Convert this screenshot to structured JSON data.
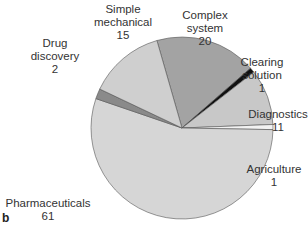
{
  "chart_data": {
    "type": "pie",
    "title": "",
    "panel_label": "b",
    "total": 112,
    "slices": [
      {
        "label": "Complex system",
        "value": 20,
        "color": "#a3a3a3"
      },
      {
        "label": "Clearing solution",
        "value": 1,
        "color": "#111111"
      },
      {
        "label": "Diagnostics",
        "value": 11,
        "color": "#c8c8c8"
      },
      {
        "label": "Agriculture",
        "value": 1,
        "color": "#f2f2f2"
      },
      {
        "label": "Pharmaceuticals",
        "value": 61,
        "color": "#d6d6d6"
      },
      {
        "label": "Drug discovery",
        "value": 2,
        "color": "#8a8a8a"
      },
      {
        "label": "Simple mechanical",
        "value": 15,
        "color": "#cfcfcf"
      }
    ]
  },
  "labels": {
    "complex_system": {
      "name": "Complex\nsystem",
      "l1": "Complex",
      "l2": "system",
      "value": "20"
    },
    "clearing_solution": {
      "l1": "Clearing",
      "l2": "solution",
      "value": "1"
    },
    "diagnostics": {
      "l1": "Diagnostics",
      "value": "11"
    },
    "agriculture": {
      "l1": "Agriculture",
      "value": "1"
    },
    "pharmaceuticals": {
      "l1": "Pharmaceuticals",
      "value": "61"
    },
    "drug_discovery": {
      "l1": "Drug",
      "l2": "discovery",
      "value": "2"
    },
    "simple_mechanical": {
      "l1": "Simple",
      "l2": "mechanical",
      "value": "15"
    }
  },
  "panel_label": "b"
}
